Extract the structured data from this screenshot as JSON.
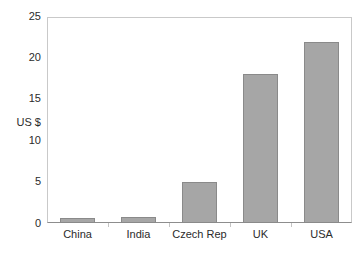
{
  "chart_data": {
    "type": "bar",
    "title": "",
    "subtitle": "",
    "xlabel": "",
    "ylabel": "US $",
    "categories": [
      "China",
      "India",
      "Czech Rep",
      "UK",
      "USA"
    ],
    "values": [
      0.6,
      0.7,
      5.0,
      18.1,
      22.0
    ],
    "series": [
      {
        "name": "US $",
        "values": [
          0.6,
          0.7,
          5.0,
          18.1,
          22.0
        ]
      }
    ],
    "ylim": [
      0,
      25
    ],
    "yticks": [
      0,
      5,
      10,
      15,
      20,
      25
    ],
    "ytick_labels": [
      "0",
      "5",
      "10",
      "15",
      "20",
      "25"
    ],
    "grid": false,
    "legend": false,
    "legend_position": "none",
    "bar_color": "#a6a6a6",
    "bar_edge_color": "#8a8a8a",
    "axis_color": "#8d8d8d",
    "frame_color": "#c9c9c9",
    "text_color": "#2b2b2b",
    "background": "#ffffff"
  },
  "caption": {
    "fragment": ""
  }
}
